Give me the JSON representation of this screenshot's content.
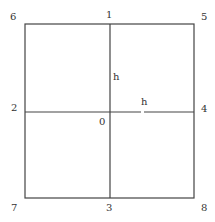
{
  "diagram": {
    "nodes": {
      "n0": "0",
      "n1": "1",
      "n2": "2",
      "n3": "3",
      "n4": "4",
      "n5": "5",
      "n6": "6",
      "n7": "7",
      "n8": "8"
    },
    "spacing_labels": {
      "vertical": "h",
      "horizontal": "h"
    },
    "colors": {
      "line": "#444444",
      "text": "#333333",
      "background": "#ffffff"
    }
  }
}
